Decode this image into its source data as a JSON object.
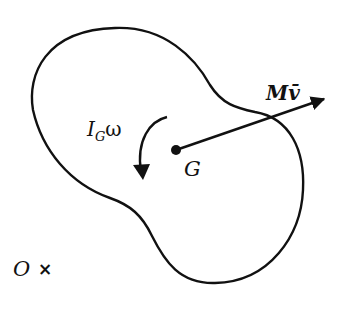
{
  "diagram": {
    "type": "rigid-body-momentum",
    "colors": {
      "stroke": "#111111",
      "background": "#ffffff"
    },
    "labels": {
      "angular_momentum": {
        "main": "I",
        "sub": "G",
        "tail": "ω"
      },
      "center_of_mass": "G",
      "linear_momentum": {
        "main": "M",
        "var": "v̄"
      },
      "origin": "O",
      "origin_marker": "×"
    }
  }
}
